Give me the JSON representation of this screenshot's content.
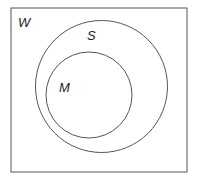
{
  "diagram": {
    "type": "venn",
    "universe": {
      "label": "W",
      "rect": {
        "x": 11,
        "y": 8,
        "width": 176,
        "height": 164
      }
    },
    "sets": [
      {
        "label": "S",
        "cx": 101.5,
        "cy": 86.5,
        "r": 66,
        "label_pos": {
          "x": 88,
          "y": 40
        }
      },
      {
        "label": "M",
        "cx": 89,
        "cy": 95,
        "r": 43,
        "label_pos": {
          "x": 59,
          "y": 92
        }
      }
    ],
    "relation": "M is a subset of S, S is a subset of W",
    "colors": {
      "stroke": "#555555",
      "background": "#ffffff",
      "text": "#222222"
    }
  }
}
